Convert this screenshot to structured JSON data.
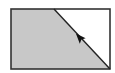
{
  "diagram": {
    "type": "rectangle-split-by-diagonal",
    "rect": {
      "x": 11,
      "y": 9,
      "width": 99,
      "height": 60
    },
    "diagonal": {
      "x1": 54,
      "y1": 9,
      "x2": 110,
      "y2": 69
    },
    "arrow": {
      "x": 80,
      "y": 37,
      "direction": "up-left-along-diagonal"
    },
    "colors": {
      "shaded_region": "#c8c8c8",
      "unshaded_region": "#ffffff",
      "stroke": "#333333",
      "arrow": "#111111"
    }
  }
}
